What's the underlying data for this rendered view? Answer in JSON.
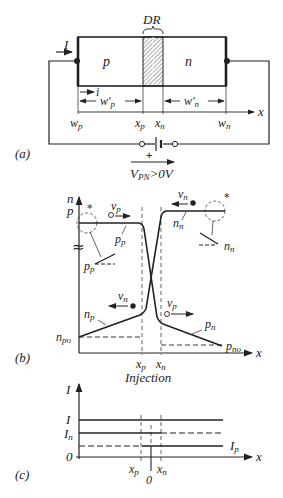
{
  "panel_a": {
    "label": "(a)",
    "region_p": "p",
    "region_n": "n",
    "depletion_label": "DR",
    "current_label": "I",
    "small_current_label": "i",
    "wp_prime": "w'p",
    "wn_prime": "w'n",
    "ticks": [
      "wp",
      "xp",
      "xn",
      "wn"
    ],
    "axis_label": "x",
    "battery_plus": "+",
    "voltage_label": "VPN>0V"
  },
  "panel_b": {
    "label": "(b)",
    "y_axis_label_top": "n",
    "y_axis_label_bottom": "p",
    "axis_label": "x",
    "ticks": [
      "xp",
      "xn"
    ],
    "caption": "Injection",
    "curves": [
      "pp",
      "nn",
      "np",
      "pn"
    ],
    "levels": [
      "npo",
      "pno"
    ],
    "velocity_labels": [
      "vp",
      "vn",
      "vn",
      "vp"
    ],
    "inset_labels": [
      "pp",
      "nn"
    ],
    "star": "*",
    "break_symbol": "≈"
  },
  "panel_c": {
    "label": "(c)",
    "y_axis_label": "I",
    "axis_label": "x",
    "levels": [
      "I",
      "In",
      "0"
    ],
    "right_label": "Ip",
    "ticks": [
      "xp",
      "xn"
    ],
    "origin": "0"
  }
}
